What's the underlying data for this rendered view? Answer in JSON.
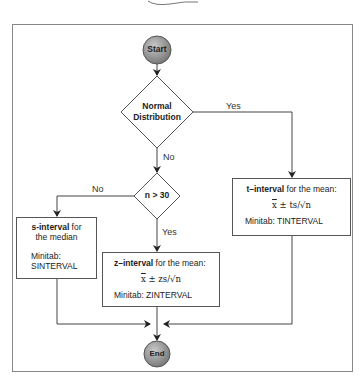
{
  "diagram": {
    "start": {
      "label": "Start"
    },
    "end": {
      "label": "End"
    },
    "decision_normal": {
      "line1": "Normal",
      "line2": "Distribution",
      "yes_label": "Yes",
      "no_label": "No"
    },
    "decision_n": {
      "label": "n > 30",
      "yes_label": "Yes",
      "no_label": "No"
    },
    "t_interval": {
      "title_bold": "t–interval",
      "title_rest": " for the mean:",
      "formula_x": "x",
      "formula_rest": " ± ts/√n",
      "minitab": "Minitab: TINTERVAL"
    },
    "z_interval": {
      "title_bold": "z–interval",
      "title_rest": " for the mean:",
      "formula_x": "x",
      "formula_rest": " ± zs/√n",
      "minitab": "Minitab: ZINTERVAL"
    },
    "s_interval": {
      "title_bold": "s-interval",
      "title_rest": " for",
      "title_line2": "the median",
      "minitab_line1": "Minitab:",
      "minitab_line2": "SINTERVAL"
    },
    "colors": {
      "terminal_fill": "#9a9a9a",
      "line": "#555555",
      "frame": "#888888"
    }
  }
}
